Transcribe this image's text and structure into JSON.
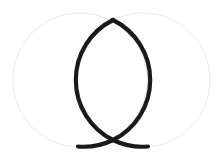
{
  "canvas": {
    "width": 223,
    "height": 159,
    "background_color": "#ffffff"
  },
  "figure": {
    "name": "vesica-piscis-ichthys"
  },
  "geometry": {
    "construction_circles": {
      "stroke_color": "#ebebeb",
      "stroke_width": 1,
      "fill": "none",
      "radius": 67,
      "items": [
        {
          "name": "left-construction-circle",
          "cx": 80,
          "cy": 80,
          "r": 67
        },
        {
          "name": "right-construction-circle",
          "cx": 143,
          "cy": 80,
          "r": 67
        }
      ]
    },
    "vesica_arcs": {
      "stroke_color": "#1a1a1a",
      "stroke_width": 4.2,
      "fill": "none",
      "top_vertex": {
        "x": 113,
        "y": 20
      },
      "crossing_point": {
        "x": 113,
        "y": 140
      },
      "left_bulge_x": 82,
      "right_bulge_x": 145,
      "left_tail_end": {
        "x": 78,
        "y": 147
      },
      "right_tail_end": {
        "x": 148,
        "y": 147
      },
      "paths": [
        {
          "name": "left-vesica-arc",
          "belongs_to_circle": "right-construction-circle",
          "d": "M 113 20 A 67 67 0 0 0 113 140 A 67 67 0 0 0 148 146.5"
        },
        {
          "name": "right-vesica-arc",
          "belongs_to_circle": "left-construction-circle",
          "d": "M 113 20 A 67 67 0 0 1 113 140 A 67 67 0 0 1 78 146.5"
        }
      ]
    }
  },
  "colors": {
    "stroke_dark": "#1a1a1a",
    "stroke_faint": "#ebebeb",
    "background": "#ffffff"
  }
}
